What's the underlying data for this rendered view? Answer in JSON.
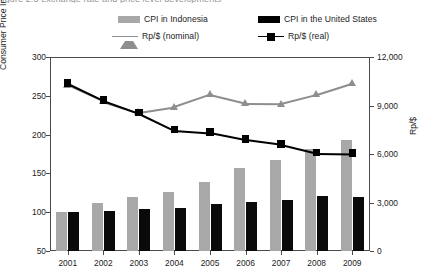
{
  "clipped_title": "figure 2.3 exchange rate and price level developments",
  "legend": {
    "items": [
      {
        "label": "CPI in Indonesia",
        "marker": "bar",
        "color": "#a8a8a8"
      },
      {
        "label": "CPI in the United States",
        "marker": "bar",
        "color": "#000000"
      },
      {
        "label": "Rp/$ (nominal)",
        "marker": "line-triangle",
        "color": "#8e8e8e"
      },
      {
        "label": "Rp/$ (real)",
        "marker": "line-square",
        "color": "#000000"
      }
    ]
  },
  "chart_data": {
    "type": "bar",
    "title": "",
    "xlabel": "",
    "ylabel": "Consumer Price Index (2000=100)",
    "y2label": "Rp/$",
    "categories": [
      "2001",
      "2002",
      "2003",
      "2004",
      "2005",
      "2006",
      "2007",
      "2008",
      "2009"
    ],
    "ylim": [
      50,
      300
    ],
    "yticks": [
      50,
      100,
      150,
      200,
      250,
      300
    ],
    "ytick_labels": [
      "50",
      "100",
      "150",
      "200",
      "250",
      "300"
    ],
    "y2lim": [
      0,
      12000
    ],
    "y2ticks": [
      0,
      3000,
      6000,
      9000,
      12000
    ],
    "y2tick_labels": [
      "0",
      "3,000",
      "6,000",
      "9,000",
      "12,000"
    ],
    "grid": false,
    "legend_position": "top",
    "series": [
      {
        "name": "CPI in Indonesia",
        "type": "bar",
        "axis": "left",
        "values": [
          100,
          112,
          119,
          126,
          139,
          157,
          167,
          182,
          193
        ]
      },
      {
        "name": "CPI in the United States",
        "type": "bar",
        "axis": "left",
        "values": [
          100,
          102,
          104,
          106,
          110,
          113,
          116,
          121,
          120
        ]
      },
      {
        "name": "Rp/$ (nominal)",
        "type": "line",
        "axis": "right",
        "values": [
          10300,
          9300,
          8600,
          8940,
          9700,
          9160,
          9140,
          9700,
          10400
        ]
      },
      {
        "name": "Rp/$ (real)",
        "type": "line",
        "axis": "right",
        "values": [
          10400,
          9350,
          8560,
          7500,
          7350,
          6920,
          6630,
          6090,
          6060
        ]
      }
    ]
  }
}
